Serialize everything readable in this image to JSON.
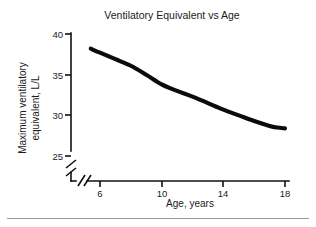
{
  "figure": {
    "title": "Ventilatory Equivalent vs Age",
    "x_axis_label": "Age, years",
    "y_axis_label_line1": "Maximum ventilatory",
    "y_axis_label_line2": "equivalent, L/L",
    "x_tick_labels": [
      "6",
      "10",
      "14",
      "18"
    ],
    "y_tick_labels": [
      "40",
      "35",
      "30",
      "25"
    ],
    "axis_break_note": "broken-axis",
    "curve_color": "#0b0b0b",
    "axis_color": "#111111",
    "background_color": "#ffffff",
    "rule_color": "#9a9a9a"
  },
  "chart_data": {
    "type": "line",
    "title": "Ventilatory Equivalent vs Age",
    "xlabel": "Age, years",
    "ylabel": "Maximum ventilatory equivalent, L/L",
    "xlim": [
      4.2,
      18.6
    ],
    "ylim": [
      23.0,
      40.0
    ],
    "xticks": [
      6,
      10,
      14,
      18
    ],
    "yticks": [
      25,
      30,
      35,
      40
    ],
    "grid": false,
    "legend": false,
    "axis_break": {
      "y_axis": true,
      "x_axis": true,
      "below_value": 25
    },
    "series": [
      {
        "name": "Maximum ventilatory equivalent",
        "x": [
          5.4,
          6,
          7,
          8,
          9,
          10,
          11,
          12,
          13,
          14,
          15,
          16,
          17,
          17.5,
          18
        ],
        "values": [
          38.2,
          37.7,
          36.9,
          36.1,
          35.0,
          33.8,
          33.0,
          32.3,
          31.5,
          30.7,
          30.0,
          29.3,
          28.7,
          28.5,
          28.4
        ]
      }
    ]
  }
}
